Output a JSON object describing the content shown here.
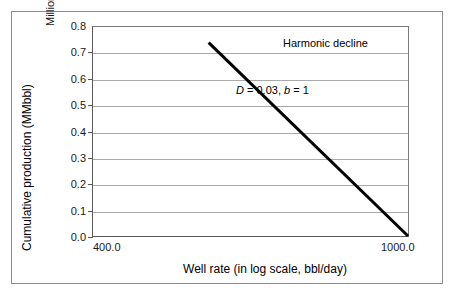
{
  "chart_data": {
    "type": "line",
    "title": "",
    "subtitle": "",
    "xlabel": "Well rate (in log scale, bbl/day)",
    "ylabel": "Cumulative production (MMbbl)",
    "y_unit_label": "Millions",
    "xscale": "log",
    "yscale": "linear",
    "xlim": [
      400.0,
      1000.0
    ],
    "ylim": [
      0.0,
      0.8
    ],
    "grid": true,
    "grid_axis": "y",
    "legend": false,
    "legend_position": "none",
    "x_ticklabels": [
      "400.0",
      "1000.0"
    ],
    "x_tickvalues": [
      400.0,
      1000.0
    ],
    "y_ticklabels": [
      "0.0",
      "0.1",
      "0.2",
      "0.3",
      "0.4",
      "0.5",
      "0.6",
      "0.7",
      "0.8"
    ],
    "y_tickvalues": [
      0.0,
      0.1,
      0.2,
      0.3,
      0.4,
      0.5,
      0.6,
      0.7,
      0.8
    ],
    "series": [
      {
        "name": "Harmonic decline",
        "color": "#000000",
        "linewidth": 3,
        "x": [
          560.0,
          1000.0
        ],
        "y": [
          0.74,
          0.0
        ]
      }
    ],
    "annotations": [
      {
        "text": "Harmonic decline",
        "x": 840.0,
        "y": 0.755
      },
      {
        "text": "D = 0.03, b = 1",
        "x": 720.0,
        "y": 0.575
      }
    ]
  },
  "annotations": {
    "harmonic_decline": "Harmonic decline",
    "params_d_label": "D",
    "params_d_eq": " = 0.03, ",
    "params_b_label": "b",
    "params_b_eq": " = 1"
  },
  "axes": {
    "y_title": "Cumulative production (MMbbl)",
    "y_unit": "Millions",
    "x_title": "Well rate (in log scale, bbl/day)",
    "y_ticks": [
      "0.8",
      "0.7",
      "0.6",
      "0.5",
      "0.4",
      "0.3",
      "0.2",
      "0.1",
      "0.0"
    ],
    "x_tick_min": "400.0",
    "x_tick_max": "1000.0"
  },
  "colors": {
    "series_line": "#000000",
    "gridline": "#a9a9a9",
    "axis": "#5a5a5a",
    "frame": "#8d8d8d",
    "text": "#000000",
    "background": "#ffffff"
  }
}
